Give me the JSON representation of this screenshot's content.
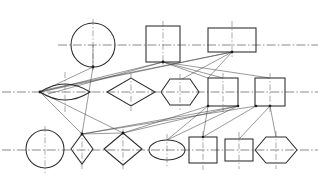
{
  "document": {
    "title": "Geometric Shape Network Diagram",
    "top_text_fragment": "",
    "background_color": "#ffffff",
    "line_color": "#2b2b2b",
    "centerline_color": "#6e6e72",
    "connector_color": "#454549",
    "width": 318,
    "height": 186
  },
  "diagram": {
    "rows": [
      {
        "name": "top-row",
        "axis_y": 45,
        "axis_x1": 0,
        "axis_x2": 318
      },
      {
        "name": "middle-row",
        "axis_y": 92,
        "axis_x1": 0,
        "axis_x2": 318
      },
      {
        "name": "bottom-row",
        "axis_y": 150,
        "axis_x1": 0,
        "axis_x2": 318
      }
    ],
    "shapes": [
      {
        "id": "s1",
        "kind": "circle",
        "row": "top",
        "cx": 93,
        "cy": 45,
        "rx": 22,
        "ry": 22
      },
      {
        "id": "s2",
        "kind": "square",
        "row": "top",
        "cx": 163,
        "cy": 44,
        "rx": 17,
        "ry": 18
      },
      {
        "id": "s3",
        "kind": "rectangle",
        "row": "top",
        "cx": 232,
        "cy": 40,
        "rx": 24,
        "ry": 12
      },
      {
        "id": "s4",
        "kind": "lens",
        "row": "middle",
        "cx": 65,
        "cy": 92,
        "rx": 25,
        "ry": 14
      },
      {
        "id": "s5",
        "kind": "diamond",
        "row": "middle",
        "cx": 131,
        "cy": 92,
        "rx": 24,
        "ry": 14
      },
      {
        "id": "s6",
        "kind": "hexagon",
        "row": "middle",
        "cx": 180,
        "cy": 92,
        "rx": 19,
        "ry": 13
      },
      {
        "id": "s7",
        "kind": "square",
        "row": "middle",
        "cx": 223,
        "cy": 92,
        "rx": 15,
        "ry": 14
      },
      {
        "id": "s8",
        "kind": "square",
        "row": "middle",
        "cx": 270,
        "cy": 92,
        "rx": 15,
        "ry": 14
      },
      {
        "id": "s9",
        "kind": "circle",
        "row": "bottom",
        "cx": 45,
        "cy": 149,
        "rx": 19,
        "ry": 19
      },
      {
        "id": "s10",
        "kind": "diamond",
        "row": "bottom",
        "cx": 82,
        "cy": 149,
        "rx": 11,
        "ry": 15
      },
      {
        "id": "s11",
        "kind": "diamond",
        "row": "bottom",
        "cx": 123,
        "cy": 149,
        "rx": 19,
        "ry": 16
      },
      {
        "id": "s12",
        "kind": "ellipse",
        "row": "bottom",
        "cx": 167,
        "cy": 150,
        "rx": 18,
        "ry": 10
      },
      {
        "id": "s13",
        "kind": "square",
        "row": "bottom",
        "cx": 203,
        "cy": 150,
        "rx": 14,
        "ry": 13
      },
      {
        "id": "s14",
        "kind": "square",
        "row": "bottom",
        "cx": 239,
        "cy": 150,
        "rx": 14,
        "ry": 11
      },
      {
        "id": "s15",
        "kind": "hexagon",
        "row": "bottom",
        "cx": 276,
        "cy": 150,
        "rx": 21,
        "ry": 13
      }
    ],
    "hubs": [
      {
        "id": "h1",
        "x": 93,
        "y": 67
      },
      {
        "id": "h2",
        "x": 163,
        "y": 62
      },
      {
        "id": "h3",
        "x": 232,
        "y": 52
      },
      {
        "id": "h4",
        "x": 40,
        "y": 92
      },
      {
        "id": "h5",
        "x": 208,
        "y": 106
      },
      {
        "id": "h6",
        "x": 238,
        "y": 106
      },
      {
        "id": "h7",
        "x": 256,
        "y": 106
      },
      {
        "id": "h8",
        "x": 82,
        "y": 134
      },
      {
        "id": "h9",
        "x": 123,
        "y": 133
      },
      {
        "id": "h10",
        "x": 203,
        "y": 137
      },
      {
        "id": "h11",
        "x": 255,
        "y": 106
      }
    ],
    "connectors": [
      {
        "from": [
          93,
          67
        ],
        "to": [
          40,
          92
        ]
      },
      {
        "from": [
          232,
          52
        ],
        "to": [
          40,
          92
        ]
      },
      {
        "from": [
          232,
          52
        ],
        "to": [
          44,
          90
        ]
      },
      {
        "from": [
          163,
          62
        ],
        "to": [
          40,
          92
        ]
      },
      {
        "from": [
          163,
          62
        ],
        "to": [
          48,
          94
        ]
      },
      {
        "from": [
          163,
          62
        ],
        "to": [
          208,
          78
        ]
      },
      {
        "from": [
          163,
          62
        ],
        "to": [
          223,
          78
        ]
      },
      {
        "from": [
          163,
          62
        ],
        "to": [
          270,
          78
        ]
      },
      {
        "from": [
          232,
          52
        ],
        "to": [
          208,
          78
        ]
      },
      {
        "from": [
          232,
          52
        ],
        "to": [
          180,
          79
        ]
      },
      {
        "from": [
          93,
          67
        ],
        "to": [
          82,
          134
        ]
      },
      {
        "from": [
          82,
          134
        ],
        "to": [
          123,
          133
        ]
      },
      {
        "from": [
          82,
          134
        ],
        "to": [
          238,
          106
        ]
      },
      {
        "from": [
          82,
          134
        ],
        "to": [
          255,
          106
        ]
      },
      {
        "from": [
          123,
          133
        ],
        "to": [
          238,
          106
        ]
      },
      {
        "from": [
          123,
          133
        ],
        "to": [
          208,
          106
        ]
      },
      {
        "from": [
          40,
          92
        ],
        "to": [
          123,
          133
        ]
      },
      {
        "from": [
          40,
          92
        ],
        "to": [
          82,
          134
        ]
      },
      {
        "from": [
          208,
          106
        ],
        "to": [
          203,
          137
        ]
      },
      {
        "from": [
          238,
          106
        ],
        "to": [
          167,
          140
        ]
      },
      {
        "from": [
          270,
          106
        ],
        "to": [
          239,
          139
        ]
      },
      {
        "from": [
          270,
          106
        ],
        "to": [
          276,
          137
        ]
      },
      {
        "from": [
          208,
          106
        ],
        "to": [
          167,
          140
        ]
      },
      {
        "from": [
          255,
          106
        ],
        "to": [
          203,
          137
        ]
      },
      {
        "from": [
          93,
          23
        ],
        "to": [
          93,
          67
        ]
      }
    ]
  }
}
